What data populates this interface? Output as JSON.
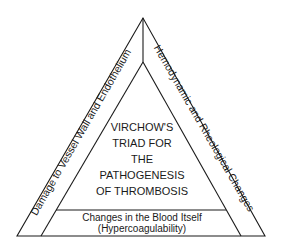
{
  "diagram": {
    "title_lines": [
      "VIRCHOW'S",
      "TRIAD FOR",
      "THE",
      "PATHOGENESIS",
      "OF THROMBOSIS"
    ],
    "left_side_label": "Damage to Vessel Wall and Endothelium",
    "right_side_label": "Hemodynamic and Rheological Changes",
    "bottom_label_line1": "Changes in the Blood Itself",
    "bottom_label_line2": "(Hypercoagulability)",
    "colors": {
      "stroke": "#1a1a1a",
      "background": "#ffffff"
    }
  }
}
